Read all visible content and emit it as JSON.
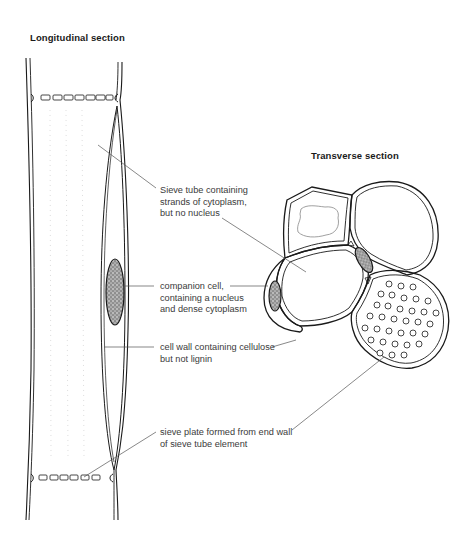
{
  "figure": {
    "type": "phloem_sieve_tube_diagram",
    "colors": {
      "background": "#ffffff",
      "outline": "#1a1a1a",
      "leader_line": "#555555",
      "label_text": "#3a3a3a",
      "heading_text": "#1a1a1a",
      "nucleus_fill": "#6a6a6a"
    }
  },
  "headings": {
    "longitudinal": "Longitudinal section",
    "transverse": "Transverse section"
  },
  "labels": [
    {
      "id": "sieve-tube",
      "text": "Sieve tube containing\nstrands of cytoplasm,\nbut no nucleus"
    },
    {
      "id": "companion-cell",
      "text": "companion cell,\ncontaining a nucleus\nand dense cytoplasm"
    },
    {
      "id": "cell-wall",
      "text": "cell wall containing cellulose\nbut not lignin"
    },
    {
      "id": "sieve-plate",
      "text": "sieve plate formed from end wall\nof sieve tube element"
    }
  ]
}
